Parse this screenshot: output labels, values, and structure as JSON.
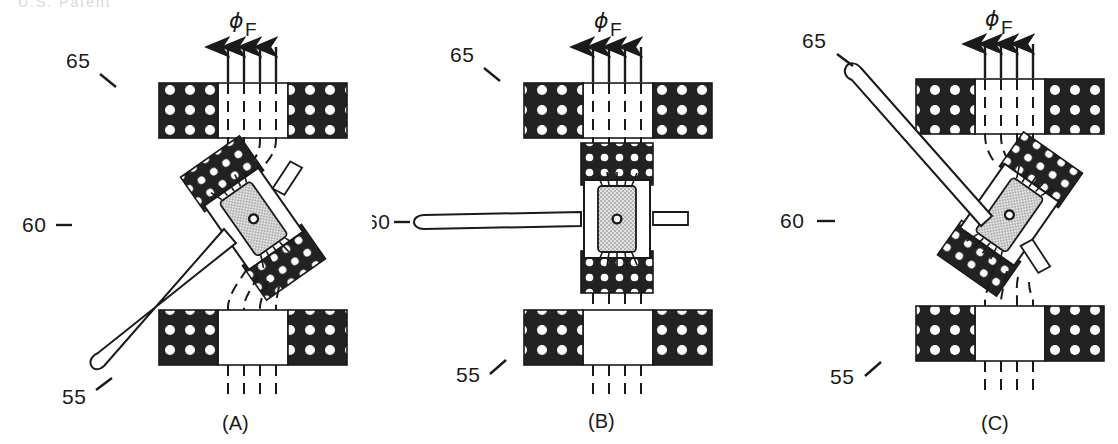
{
  "figure": {
    "title_artifact": "U.S. Patent",
    "type": "patent-drawing",
    "panel_count": 3
  },
  "labels": {
    "flux_symbol": "ϕ",
    "flux_subscript": "F",
    "ref_65": "65",
    "ref_60": "60",
    "ref_55": "55"
  },
  "panels": [
    {
      "id": "A",
      "caption": "(A)",
      "rotor_angle_deg": -35,
      "needle_direction": "down-left",
      "ref_65": "65",
      "ref_60": "60",
      "ref_55": "55",
      "flux_symbol": "ϕ",
      "flux_subscript": "F",
      "flux_line_count": 4,
      "magnet_blocks": 2,
      "pole_pieces": 2
    },
    {
      "id": "B",
      "caption": "(B)",
      "rotor_angle_deg": 0,
      "needle_direction": "left",
      "ref_65": "65",
      "ref_60": "60",
      "ref_55": "55",
      "flux_symbol": "ϕ",
      "flux_subscript": "F",
      "flux_line_count": 4,
      "magnet_blocks": 2,
      "pole_pieces": 2
    },
    {
      "id": "C",
      "caption": "(C)",
      "rotor_angle_deg": 35,
      "needle_direction": "up-left",
      "ref_65": "65",
      "ref_60": "60",
      "ref_55": "55",
      "flux_symbol": "ϕ",
      "flux_subscript": "F",
      "flux_line_count": 4,
      "magnet_blocks": 2,
      "pole_pieces": 2
    }
  ],
  "colors": {
    "ink": "#1a1a1a",
    "magnet_fill": "#222222",
    "dot_fill": "#ffffff",
    "core_stipple": "#c9c9c9",
    "background": "#ffffff"
  }
}
